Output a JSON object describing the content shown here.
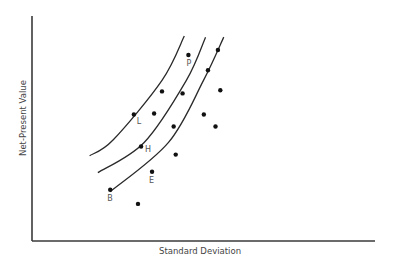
{
  "chart_data": {
    "type": "scatter",
    "title": "",
    "xlabel": "Standard Deviation",
    "ylabel": "Net-Present Value",
    "xlim": [
      0,
      100
    ],
    "ylim": [
      0,
      100
    ],
    "grid": false,
    "legend": "none",
    "ticks": false,
    "points": [
      {
        "x": 45.6,
        "y": 82.7,
        "label": "P"
      },
      {
        "x": 54.2,
        "y": 84.9,
        "label": ""
      },
      {
        "x": 51.3,
        "y": 75.9,
        "label": ""
      },
      {
        "x": 37.9,
        "y": 66.5,
        "label": ""
      },
      {
        "x": 43.9,
        "y": 65.6,
        "label": ""
      },
      {
        "x": 54.9,
        "y": 67.0,
        "label": ""
      },
      {
        "x": 29.7,
        "y": 56.2,
        "label": "L"
      },
      {
        "x": 35.6,
        "y": 56.7,
        "label": ""
      },
      {
        "x": 50.1,
        "y": 56.2,
        "label": ""
      },
      {
        "x": 41.3,
        "y": 50.9,
        "label": ""
      },
      {
        "x": 53.5,
        "y": 50.9,
        "label": ""
      },
      {
        "x": 31.8,
        "y": 42.0,
        "label": "H"
      },
      {
        "x": 41.9,
        "y": 38.4,
        "label": ""
      },
      {
        "x": 35.0,
        "y": 30.8,
        "label": "E"
      },
      {
        "x": 22.8,
        "y": 22.8,
        "label": "B"
      },
      {
        "x": 30.9,
        "y": 16.5,
        "label": ""
      }
    ],
    "curves": [
      {
        "name": "indifference-curve-1",
        "points": [
          [
            16.8,
            37.9
          ],
          [
            23.7,
            45.0
          ],
          [
            37.9,
            71.4
          ],
          [
            44.4,
            91.1
          ]
        ]
      },
      {
        "name": "indifference-curve-2",
        "points": [
          [
            19.2,
            30.4
          ],
          [
            32.7,
            43.8
          ],
          [
            45.0,
            71.4
          ],
          [
            50.6,
            90.6
          ]
        ]
      },
      {
        "name": "indifference-curve-3",
        "points": [
          [
            22.8,
            21.9
          ],
          [
            39.8,
            43.8
          ],
          [
            50.0,
            71.4
          ],
          [
            55.9,
            90.6
          ]
        ]
      }
    ]
  }
}
